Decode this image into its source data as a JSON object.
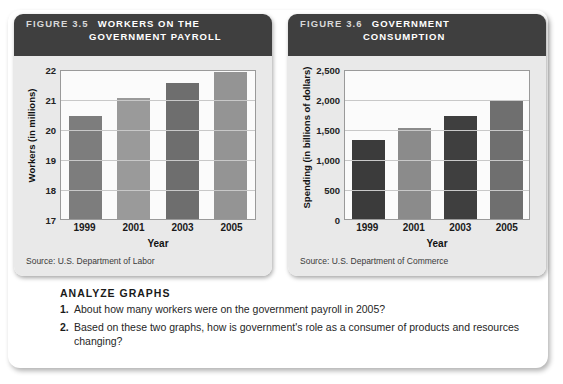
{
  "figures": [
    {
      "number": "FIGURE 3.5",
      "title_line1": "WORKERS ON THE",
      "title_line2": "GOVERNMENT PAYROLL",
      "source": "Source: U.S. Department of Labor",
      "xlabel": "Year",
      "ylabel": "Workers (in millions)",
      "yticks": [
        "22",
        "21",
        "20",
        "19",
        "18",
        "17"
      ],
      "xticks": [
        "1999",
        "2001",
        "2003",
        "2005"
      ]
    },
    {
      "number": "FIGURE 3.6",
      "title_line1": "GOVERNMENT",
      "title_line2": "CONSUMPTION",
      "source": "Source: U.S. Department of Commerce",
      "xlabel": "Year",
      "ylabel": "Spending (in billions of dollars)",
      "yticks": [
        "2,500",
        "2,000",
        "1,500",
        "1,000",
        "500",
        "0"
      ],
      "xticks": [
        "1999",
        "2001",
        "2003",
        "2005"
      ]
    }
  ],
  "chart_data": [
    {
      "type": "bar",
      "title": "FIGURE 3.5 WORKERS ON THE GOVERNMENT PAYROLL",
      "xlabel": "Year",
      "ylabel": "Workers (in millions)",
      "categories": [
        "1999",
        "2001",
        "2003",
        "2005"
      ],
      "values": [
        20.45,
        21.05,
        21.55,
        21.9
      ],
      "ylim": [
        17,
        22
      ],
      "yticks": [
        17,
        18,
        19,
        20,
        21,
        22
      ],
      "ytick_labels": [
        "17",
        "18",
        "19",
        "20",
        "21",
        "22"
      ],
      "grid": true,
      "legend": false,
      "bar_colors": [
        "#7d7d7d",
        "#9a9a9a",
        "#6e6e6e",
        "#949494"
      ],
      "source": "Source: U.S. Department of Labor"
    },
    {
      "type": "bar",
      "title": "FIGURE 3.6 GOVERNMENT CONSUMPTION",
      "xlabel": "Year",
      "ylabel": "Spending (in billions of dollars)",
      "categories": [
        "1999",
        "2001",
        "2003",
        "2005"
      ],
      "values": [
        1320,
        1510,
        1720,
        1960
      ],
      "ylim": [
        0,
        2500
      ],
      "yticks": [
        0,
        500,
        1000,
        1500,
        2000,
        2500
      ],
      "ytick_labels": [
        "0",
        "500",
        "1,000",
        "1,500",
        "2,000",
        "2,500"
      ],
      "grid": true,
      "legend": false,
      "bar_colors": [
        "#3b3b3b",
        "#8b8b8b",
        "#3f3f3f",
        "#6f6f6f"
      ],
      "source": "Source: U.S. Department of Commerce"
    }
  ],
  "analyze": {
    "heading": "ANALYZE GRAPHS",
    "questions": [
      {
        "num": "1.",
        "text": "About how many workers were on the government payroll in 2005?"
      },
      {
        "num": "2.",
        "text": "Based on these two graphs, how is government's role as a consumer of products and resources changing?"
      }
    ]
  },
  "colors": {
    "header_bar": "#3f3f3f",
    "panel_background": "#e9e9e9",
    "plot_background": "#fbfbfb",
    "gridline": "#c8c8c8",
    "card_background": "#ffffff"
  }
}
